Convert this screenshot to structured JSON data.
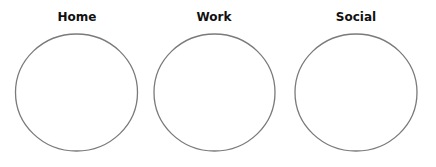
{
  "diagram": {
    "background": "#ffffff",
    "stroke_color": "#7a7a7a",
    "groups": [
      {
        "label": "Home",
        "cx": 76.5,
        "cy": 92.5,
        "rx": 61,
        "ry": 58.5
      },
      {
        "label": "Work",
        "cx": 214.5,
        "cy": 92.5,
        "rx": 60.5,
        "ry": 58.5
      },
      {
        "label": "Social",
        "cx": 356,
        "cy": 92.5,
        "rx": 61,
        "ry": 58.5
      }
    ]
  }
}
